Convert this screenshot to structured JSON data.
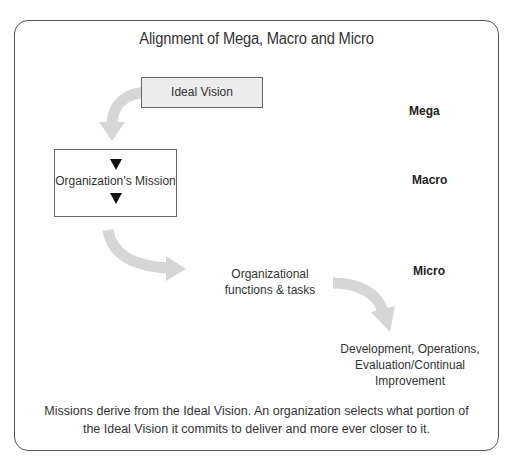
{
  "diagram": {
    "title": "Alignment of Mega, Macro and Micro",
    "nodes": {
      "ideal_vision": "Ideal Vision",
      "mission": "Organization’s Mission",
      "functions": [
        "Organizational",
        "functions & tasks"
      ],
      "development": [
        "Development, Operations,",
        "Evaluation/Continual",
        "Improvement"
      ]
    },
    "levels": {
      "mega": "Mega",
      "macro": "Macro",
      "micro": "Micro"
    },
    "note": [
      "Missions derive from the Ideal Vision. An organization selects what portion of",
      "the Ideal Vision it commits to deliver and more ever closer to it."
    ],
    "colors": {
      "arrow": "#d6d6d6",
      "frame": "#555555",
      "ideal_box_fill": "#ececec",
      "marker": "#111111"
    }
  }
}
